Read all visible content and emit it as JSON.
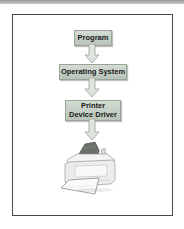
{
  "diagram": {
    "title_bar": "",
    "nodes": [
      {
        "id": "program",
        "lines": [
          "Program"
        ]
      },
      {
        "id": "operating-system",
        "lines": [
          "Operating System"
        ]
      },
      {
        "id": "printer-driver",
        "lines": [
          "Printer",
          "Device Driver"
        ]
      }
    ],
    "edges": [
      {
        "from": "program",
        "to": "operating-system"
      },
      {
        "from": "operating-system",
        "to": "printer-driver"
      },
      {
        "from": "printer-driver",
        "to": "printer"
      }
    ],
    "terminal": {
      "id": "printer",
      "icon": "printer-icon"
    },
    "colors": {
      "node_fill": "#c6d0c6",
      "node_border": "#9aa59a",
      "arrow_fill": "#dfe4df",
      "arrow_stroke": "#9aa09a",
      "frame_border": "#4a4a4a"
    }
  }
}
